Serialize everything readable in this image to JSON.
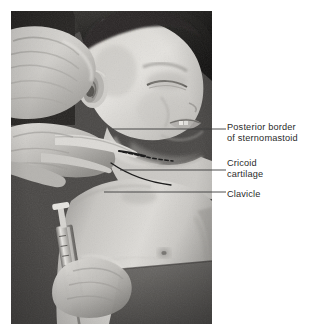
{
  "figure": {
    "kind": "clinical-photograph-with-annotations",
    "background_color": "#ffffff",
    "photo": {
      "description": "Black and white clinical photograph of a supine child with the head turned to the side; an examiner's hands palpate the side of the neck while a syringe is held near the lower chest.",
      "tone": "grayscale",
      "frame_color": "#8d8d8d",
      "subjects": [
        "child-head",
        "examiner-hand-upper",
        "examiner-hand-lower",
        "child-chest",
        "syringe"
      ]
    },
    "overlay_markings": [
      {
        "name": "sternomastoid-border-dashed-line",
        "style": "dashed",
        "color": "#1a1a1a"
      },
      {
        "name": "clavicle-outline",
        "style": "solid",
        "color": "#1a1a1a"
      }
    ]
  },
  "annotations": {
    "line_color": "#3a3a3a",
    "text_color": "#2b2b2b",
    "items": [
      {
        "id": "posterior-border",
        "label": "Posterior border\nof sternomastoid",
        "leader_y": 129
      },
      {
        "id": "cricoid-cartilage",
        "label": "Cricoid\ncartilage",
        "leader_y": 170
      },
      {
        "id": "clavicle",
        "label": "Clavicle",
        "leader_y": 192
      }
    ]
  }
}
